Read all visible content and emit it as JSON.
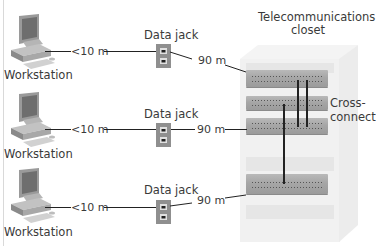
{
  "diagram": {
    "closet": {
      "title_line1": "Telecommunications",
      "title_line2": "closet",
      "cross_connect_line1": "Cross-",
      "cross_connect_line2": "connect"
    },
    "rows": [
      {
        "workstation_label": "Workstation",
        "short_cable": "<10 m",
        "jack_label": "Data jack",
        "long_cable": "90 m"
      },
      {
        "workstation_label": "Workstation",
        "short_cable": "<10 m",
        "jack_label": "Data jack",
        "long_cable": "90 m"
      },
      {
        "workstation_label": "Workstation",
        "short_cable": "<10 m",
        "jack_label": "Data jack",
        "long_cable": "90 m"
      }
    ],
    "colors": {
      "cable": "#222222",
      "jack_plate": "#8f8f8f",
      "panel": "#a8a8a8",
      "rack": "#f1f1f1"
    }
  }
}
